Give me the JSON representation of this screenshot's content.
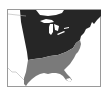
{
  "map": {
    "title": "",
    "description": "Range map of eastern North America with two shaded regions",
    "colors": {
      "background": "#ffffff",
      "frame": "#9a9a9a",
      "northern_region": "#262626",
      "southern_region": "#7a7a7a",
      "water": "#ffffff",
      "borders": "#b0b0b0"
    },
    "regions": [
      {
        "name": "northern-range",
        "shade": "dark"
      },
      {
        "name": "southern-range",
        "shade": "gray"
      }
    ]
  }
}
